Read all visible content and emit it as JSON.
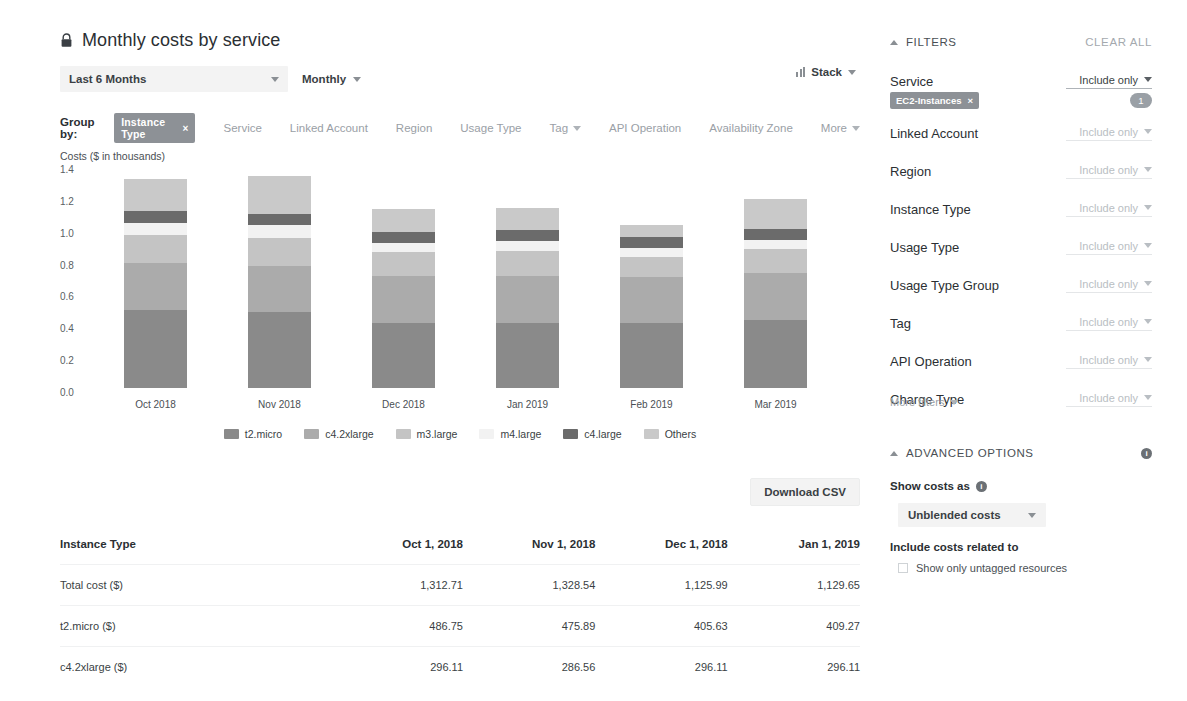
{
  "header": {
    "title": "Monthly costs by service",
    "lock_icon": "lock-icon",
    "date_range": "Last 6 Months",
    "granularity": "Monthly",
    "stack_label": "Stack",
    "stack_icon": "bar-chart-icon"
  },
  "group_by": {
    "label": "Group by:",
    "selected_chip": "Instance Type",
    "chip_remove": "×",
    "options": [
      "Service",
      "Linked Account",
      "Region",
      "Usage Type",
      "Tag",
      "API Operation",
      "Availability Zone",
      "More"
    ],
    "caret_options": [
      "Tag",
      "More"
    ]
  },
  "chart_data": {
    "type": "bar",
    "stacked": true,
    "title": "",
    "ylabel": "Costs ($ in thousands)",
    "xlabel": "",
    "ylim": [
      0.0,
      1.4
    ],
    "yticks": [
      "1.4",
      "1.2",
      "1.0",
      "0.8",
      "0.6",
      "0.4",
      "0.2",
      "0.0"
    ],
    "grid": false,
    "legend_position": "bottom",
    "categories": [
      "Oct 2018",
      "Nov 2018",
      "Dec 2018",
      "Jan 2019",
      "Feb 2019",
      "Mar 2019"
    ],
    "series": [
      {
        "name": "t2.micro",
        "color": "#8a8a8a",
        "values": [
          0.487,
          0.476,
          0.406,
          0.409,
          0.41,
          0.425
        ]
      },
      {
        "name": "c4.2xlarge",
        "color": "#ababab",
        "values": [
          0.296,
          0.287,
          0.296,
          0.296,
          0.29,
          0.296
        ]
      },
      {
        "name": "m3.large",
        "color": "#c4c4c4",
        "values": [
          0.178,
          0.18,
          0.15,
          0.155,
          0.12,
          0.15
        ]
      },
      {
        "name": "m4.large",
        "color": "#f2f2f2",
        "values": [
          0.075,
          0.08,
          0.06,
          0.065,
          0.06,
          0.06
        ]
      },
      {
        "name": "c4.large",
        "color": "#6b6b6b",
        "values": [
          0.075,
          0.07,
          0.065,
          0.07,
          0.068,
          0.07
        ]
      },
      {
        "name": "Others",
        "color": "#c9c9c9",
        "values": [
          0.202,
          0.236,
          0.148,
          0.135,
          0.077,
          0.185
        ]
      }
    ],
    "totals": [
      1.31271,
      1.32854,
      1.12599,
      1.12965,
      1.025,
      1.186
    ]
  },
  "table": {
    "download_label": "Download CSV",
    "columns": [
      "Instance Type",
      "Oct 1, 2018",
      "Nov 1, 2018",
      "Dec 1, 2018",
      "Jan 1, 2019"
    ],
    "rows": [
      {
        "label": "Total cost ($)",
        "values": [
          "1,312.71",
          "1,328.54",
          "1,125.99",
          "1,129.65"
        ]
      },
      {
        "label": "t2.micro ($)",
        "values": [
          "486.75",
          "475.89",
          "405.63",
          "409.27"
        ]
      },
      {
        "label": "c4.2xlarge ($)",
        "values": [
          "296.11",
          "286.56",
          "296.11",
          "296.11"
        ]
      }
    ]
  },
  "sidebar": {
    "filters_title": "FILTERS",
    "clear_all": "CLEAR ALL",
    "service": {
      "name": "Service",
      "control": "Include only",
      "chip": "EC2-Instances",
      "chip_remove": "×",
      "count": "1"
    },
    "filters": [
      {
        "name": "Linked Account",
        "control": "Include only"
      },
      {
        "name": "Region",
        "control": "Include only"
      },
      {
        "name": "Instance Type",
        "control": "Include only"
      },
      {
        "name": "Usage Type",
        "control": "Include only"
      },
      {
        "name": "Usage Type Group",
        "control": "Include only"
      },
      {
        "name": "Tag",
        "control": "Include only"
      },
      {
        "name": "API Operation",
        "control": "Include only"
      },
      {
        "name": "Charge Type",
        "control": "Include only"
      }
    ],
    "more_filters": "More filters",
    "advanced": {
      "title": "ADVANCED OPTIONS",
      "info_icon": "info-icon",
      "show_costs_as_label": "Show costs as",
      "show_costs_as_value": "Unblended costs",
      "include_costs_label": "Include costs related to",
      "untagged_label": "Show only untagged resources"
    }
  }
}
